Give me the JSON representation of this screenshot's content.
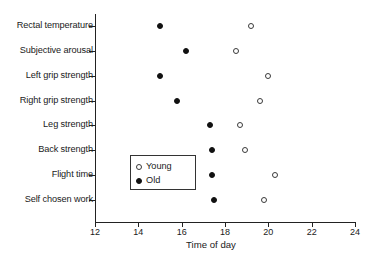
{
  "chart_data": {
    "type": "scatter",
    "title": "",
    "xlabel": "Time of day",
    "ylabel": "",
    "xlim": [
      12,
      24
    ],
    "xticks": [
      12,
      14,
      16,
      18,
      20,
      22,
      24
    ],
    "grid": false,
    "legend_position": "center-left",
    "categories": [
      "Rectal temperature",
      "Subjective arousal",
      "Left grip strength",
      "Right grip strength",
      "Leg strength",
      "Back strength",
      "Flight time",
      "Self chosen work"
    ],
    "series": [
      {
        "name": "Young",
        "marker": "open-circle",
        "color": "#ffffff",
        "values": [
          19.2,
          18.5,
          20.0,
          19.6,
          18.7,
          18.9,
          20.3,
          19.8
        ]
      },
      {
        "name": "Old",
        "marker": "filled-diamond",
        "color": "#111111",
        "values": [
          15.0,
          16.2,
          15.0,
          15.8,
          17.3,
          17.4,
          17.4,
          17.5
        ]
      }
    ]
  },
  "legend": {
    "entries": [
      {
        "label": "Young",
        "marker": "young"
      },
      {
        "label": "Old",
        "marker": "old"
      }
    ]
  }
}
